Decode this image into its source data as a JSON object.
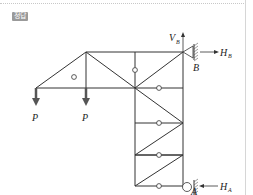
{
  "badge": {
    "label": "정답"
  },
  "diagram": {
    "type": "truss free-body diagram",
    "loads": [
      {
        "label": "P",
        "direction": "down",
        "position": "left bottom node"
      },
      {
        "label": "P",
        "direction": "down",
        "position": "second bottom node"
      }
    ],
    "supports": [
      {
        "label": "B",
        "type": "pin",
        "reactions": [
          "V_B",
          "H_B"
        ]
      },
      {
        "label": "A",
        "type": "roller",
        "reactions": [
          "H_A"
        ]
      }
    ],
    "labels": {
      "load_left": "P",
      "load_right": "P",
      "vb": "V",
      "vb_sub": "B",
      "hb": "H",
      "hb_sub": "B",
      "support_b": "B",
      "ha": "H",
      "ha_sub": "A",
      "support_a": "A"
    },
    "colors": {
      "line": "#333333",
      "load": "#555555",
      "badge": "#9a9a9a"
    }
  }
}
